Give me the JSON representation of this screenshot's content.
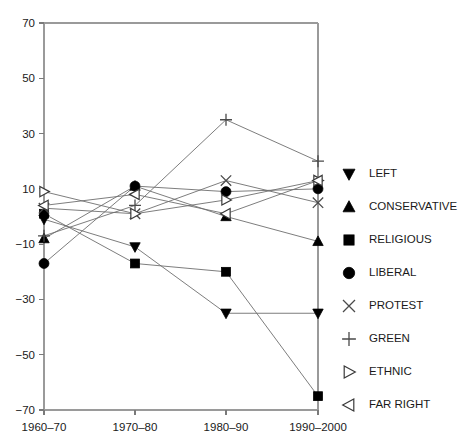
{
  "chart_data": {
    "type": "line",
    "title": "",
    "xlabel": "",
    "ylabel": "",
    "categories": [
      "1960–70",
      "1970–80",
      "1980–90",
      "1990–2000"
    ],
    "ylim": [
      -70,
      70
    ],
    "yticks": [
      70,
      50,
      30,
      10,
      -10,
      -30,
      -50,
      -70
    ],
    "ytick_labels": [
      "70",
      "50",
      "30",
      "10",
      "−10",
      "−30",
      "−50",
      "−70"
    ],
    "grid": false,
    "legend_position": "right",
    "series": [
      {
        "name": "LEFT",
        "marker": "triangle-down",
        "filled": true,
        "values": [
          -1,
          -11,
          -35,
          -35
        ]
      },
      {
        "name": "CONSERVATIVE",
        "marker": "triangle-up",
        "filled": true,
        "values": [
          -8,
          11,
          0,
          -9
        ]
      },
      {
        "name": "RELIGIOUS",
        "marker": "square",
        "filled": true,
        "values": [
          1,
          -17,
          -20,
          -65
        ]
      },
      {
        "name": "LIBERAL",
        "marker": "circle",
        "filled": true,
        "values": [
          -17,
          11,
          9,
          10
        ]
      },
      {
        "name": "PROTEST",
        "marker": "cross-x",
        "filled": false,
        "values": [
          3,
          1,
          13,
          5
        ]
      },
      {
        "name": "GREEN",
        "marker": "plus",
        "filled": false,
        "values": [
          -7,
          4,
          35,
          20
        ]
      },
      {
        "name": "ETHNIC",
        "marker": "triangle-right",
        "filled": false,
        "values": [
          9,
          1,
          6,
          13
        ]
      },
      {
        "name": "FAR RIGHT",
        "marker": "triangle-left",
        "filled": false,
        "values": [
          4,
          8,
          1,
          13
        ]
      }
    ]
  },
  "legend": {
    "items": [
      {
        "label": "LEFT",
        "icon": "triangle-down-solid-icon"
      },
      {
        "label": "CONSERVATIVE",
        "icon": "triangle-up-solid-icon"
      },
      {
        "label": "RELIGIOUS",
        "icon": "square-solid-icon"
      },
      {
        "label": "LIBERAL",
        "icon": "circle-solid-icon"
      },
      {
        "label": "PROTEST",
        "icon": "cross-x-icon"
      },
      {
        "label": "GREEN",
        "icon": "plus-icon"
      },
      {
        "label": "ETHNIC",
        "icon": "triangle-right-open-icon"
      },
      {
        "label": "FAR RIGHT",
        "icon": "triangle-left-open-icon"
      }
    ]
  },
  "colors": {
    "background": "#ffffff",
    "axis": "#9a9a9a",
    "line": "#6e6e6e",
    "marker_fill": "#000000",
    "marker_open_fill": "#ffffff",
    "text": "#1a1a1a"
  },
  "geometry": {
    "plot_left": 44,
    "plot_right": 318,
    "plot_top": 23,
    "plot_bottom": 410,
    "x_positions": [
      44,
      135,
      226,
      318
    ],
    "y_top_value": 70,
    "y_bottom_value": -70,
    "legend_x_icon": 349,
    "legend_x_text": 369,
    "legend_y_start": 174,
    "legend_y_step": 33
  }
}
